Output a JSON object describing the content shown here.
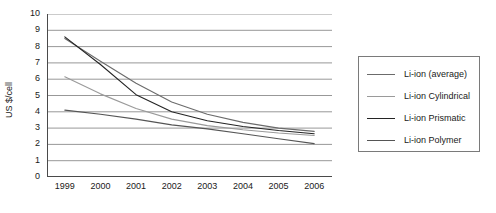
{
  "chart_data": {
    "type": "line",
    "title": "",
    "xlabel": "",
    "ylabel": "US $/cell",
    "categories": [
      "1999",
      "2000",
      "2001",
      "2002",
      "2003",
      "2004",
      "2005",
      "2006"
    ],
    "ylim": [
      0,
      10
    ],
    "ytick_values": [
      "0",
      "1",
      "2",
      "3",
      "4",
      "5",
      "6",
      "7",
      "8",
      "9",
      "10"
    ],
    "grid": "horizontal",
    "legend_position": "right",
    "series": [
      {
        "name": "Li-ion (average)",
        "color": "#6b6b6b",
        "values": [
          8.5,
          7.1,
          5.75,
          4.6,
          3.85,
          3.35,
          3.0,
          2.8
        ]
      },
      {
        "name": "Li-ion Cylindrical",
        "color": "#9a9a9a",
        "values": [
          6.15,
          5.1,
          4.2,
          3.55,
          3.15,
          2.9,
          2.7,
          2.55
        ]
      },
      {
        "name": "Li-ion Prismatic",
        "color": "#242424",
        "values": [
          8.6,
          6.9,
          5.05,
          4.0,
          3.45,
          3.1,
          2.85,
          2.65
        ]
      },
      {
        "name": "Li-ion Polymer",
        "color": "#555555",
        "values": [
          4.1,
          3.85,
          3.55,
          3.2,
          2.95,
          2.65,
          2.35,
          2.05
        ]
      }
    ]
  },
  "axes": {
    "y_axis_label": "US $/cell"
  }
}
